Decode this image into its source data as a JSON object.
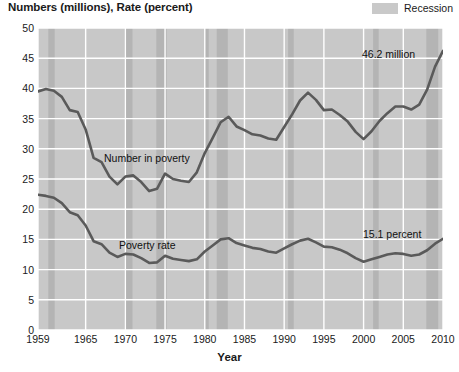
{
  "axis_title_y": "Numbers (millions), Rate (percent)",
  "axis_title_x": "Year",
  "legend": {
    "recession_label": "Recession",
    "swatch_color": "#c9c9c9"
  },
  "annotations": {
    "number_end_label": "46.2 million",
    "rate_end_label": "15.1 percent",
    "number_series_tag": "Number in poverty",
    "rate_series_tag": "Poverty rate"
  },
  "colors": {
    "plot_background": "#c8c8c8",
    "recession_band": "#b4b4b4",
    "gridline": "#ffffff",
    "line": "#5a5a5a",
    "text": "#1a1a1a"
  },
  "chart_data": {
    "type": "line",
    "title": "",
    "xlabel": "Year",
    "ylabel": "Numbers (millions), Rate (percent)",
    "xlim": [
      1959,
      2010
    ],
    "ylim": [
      0,
      50
    ],
    "grid": true,
    "legend_position": "top-right",
    "yticks": [
      0,
      5,
      10,
      15,
      20,
      25,
      30,
      35,
      40,
      45,
      50
    ],
    "xticks": [
      1959,
      1965,
      1970,
      1975,
      1980,
      1985,
      1990,
      1995,
      2000,
      2005,
      2010
    ],
    "x": [
      1959,
      1960,
      1961,
      1962,
      1963,
      1964,
      1965,
      1966,
      1967,
      1968,
      1969,
      1970,
      1971,
      1972,
      1973,
      1974,
      1975,
      1976,
      1977,
      1978,
      1979,
      1980,
      1981,
      1982,
      1983,
      1984,
      1985,
      1986,
      1987,
      1988,
      1989,
      1990,
      1991,
      1992,
      1993,
      1994,
      1995,
      1996,
      1997,
      1998,
      1999,
      2000,
      2001,
      2002,
      2003,
      2004,
      2005,
      2006,
      2007,
      2008,
      2009,
      2010
    ],
    "series": [
      {
        "name": "Number in poverty",
        "unit": "millions",
        "end_value": 46.2,
        "values": [
          39.5,
          39.9,
          39.6,
          38.6,
          36.4,
          36.1,
          33.2,
          28.5,
          27.8,
          25.4,
          24.1,
          25.4,
          25.6,
          24.5,
          23.0,
          23.4,
          25.9,
          25.0,
          24.7,
          24.5,
          26.1,
          29.3,
          31.8,
          34.4,
          35.3,
          33.7,
          33.1,
          32.4,
          32.2,
          31.7,
          31.5,
          33.6,
          35.7,
          38.0,
          39.3,
          38.1,
          36.4,
          36.5,
          35.6,
          34.5,
          32.8,
          31.6,
          32.9,
          34.6,
          35.9,
          37.0,
          37.0,
          36.5,
          37.3,
          39.8,
          43.6,
          46.2
        ]
      },
      {
        "name": "Poverty rate",
        "unit": "percent",
        "end_value": 15.1,
        "values": [
          22.4,
          22.2,
          21.9,
          21.0,
          19.5,
          19.0,
          17.3,
          14.7,
          14.2,
          12.8,
          12.1,
          12.6,
          12.5,
          11.9,
          11.1,
          11.2,
          12.3,
          11.8,
          11.6,
          11.4,
          11.7,
          13.0,
          14.0,
          15.0,
          15.2,
          14.4,
          14.0,
          13.6,
          13.4,
          13.0,
          12.8,
          13.5,
          14.2,
          14.8,
          15.1,
          14.5,
          13.8,
          13.7,
          13.3,
          12.7,
          11.9,
          11.3,
          11.7,
          12.1,
          12.5,
          12.7,
          12.6,
          12.3,
          12.5,
          13.2,
          14.3,
          15.1
        ]
      }
    ],
    "recessions": [
      {
        "start": 1960.3,
        "end": 1961.1
      },
      {
        "start": 1969.9,
        "end": 1970.9
      },
      {
        "start": 1973.9,
        "end": 1975.2
      },
      {
        "start": 1980.0,
        "end": 1980.5
      },
      {
        "start": 1981.5,
        "end": 1982.9
      },
      {
        "start": 1990.5,
        "end": 1991.2
      },
      {
        "start": 2001.2,
        "end": 2001.9
      },
      {
        "start": 2007.9,
        "end": 2009.4
      }
    ]
  }
}
